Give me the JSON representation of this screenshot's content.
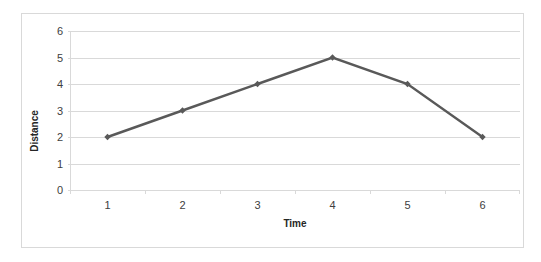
{
  "chart_data": {
    "type": "line",
    "title": "",
    "xlabel": "Time",
    "ylabel": "Distance",
    "x": [
      1,
      2,
      3,
      4,
      5,
      6
    ],
    "values": [
      2,
      3,
      4,
      5,
      4,
      2
    ],
    "series": [
      {
        "name": "Distance",
        "values": [
          2,
          3,
          4,
          5,
          4,
          2
        ]
      }
    ],
    "xtick_labels": [
      "1",
      "2",
      "3",
      "4",
      "5",
      "6"
    ],
    "ytick_labels": [
      "0",
      "1",
      "2",
      "3",
      "4",
      "5",
      "6"
    ],
    "xlim": [
      0.5,
      6.5
    ],
    "ylim": [
      0,
      6
    ],
    "grid": "horizontal",
    "legend": "none",
    "colors": {
      "line": "#595959",
      "marker": "#595959",
      "gridline": "#d9d9d9",
      "axis": "#d9d9d9",
      "border": "#d9d9d9",
      "text": "#404040",
      "title_text": "#262626",
      "background": "#ffffff"
    }
  }
}
